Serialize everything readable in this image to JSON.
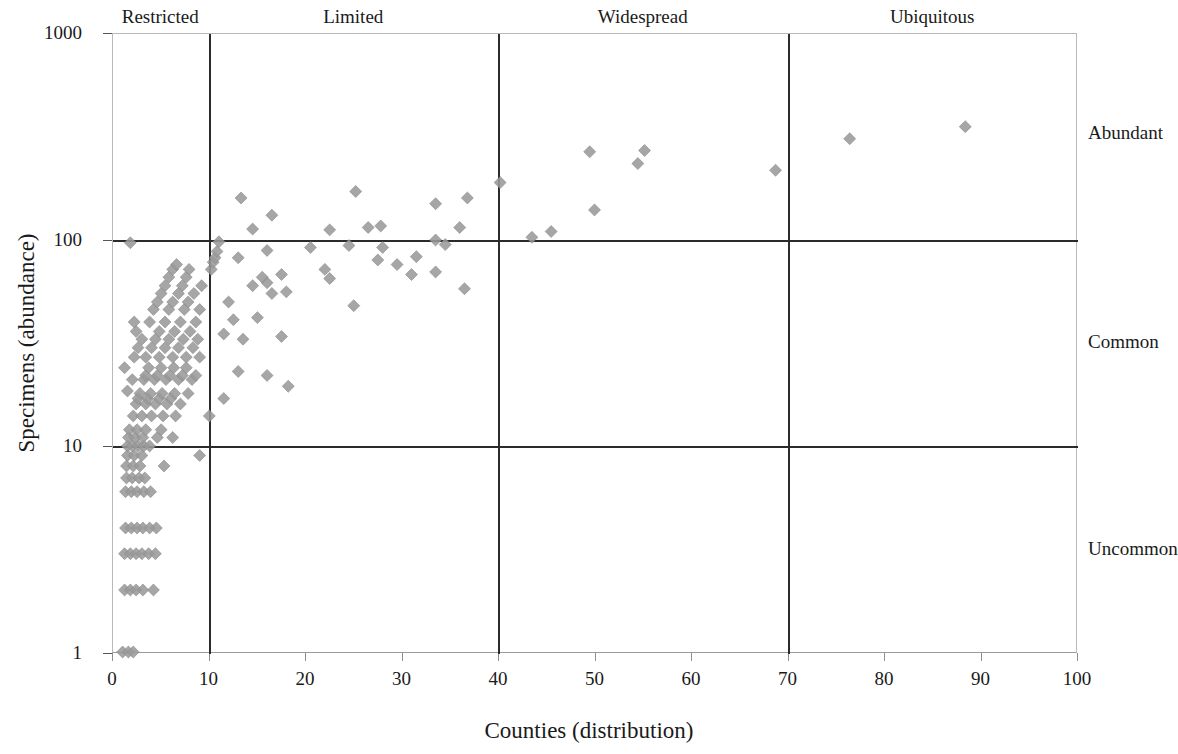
{
  "chart_data": {
    "type": "scatter",
    "title": "",
    "xlabel": "Counties (distribution)",
    "ylabel": "Specimens (abundance)",
    "xlim": [
      0,
      100
    ],
    "ylim": [
      1,
      1000
    ],
    "yscale": "log",
    "xscale": "linear",
    "grid": false,
    "legend": null,
    "marker": {
      "shape": "diamond",
      "color": "#9a9a9a",
      "size": 11
    },
    "x_ticks": [
      0,
      10,
      20,
      30,
      40,
      50,
      60,
      70,
      80,
      90,
      100
    ],
    "y_ticks": [
      1,
      10,
      100,
      1000
    ],
    "x_tick_labels": [
      "0",
      "10",
      "20",
      "30",
      "40",
      "50",
      "60",
      "70",
      "80",
      "90",
      "100"
    ],
    "y_tick_labels": [
      "1",
      "10",
      "100",
      "1000"
    ],
    "distribution_bands": [
      {
        "label": "Restricted",
        "x_range": [
          0,
          10
        ],
        "center": 5
      },
      {
        "label": "Limited",
        "x_range": [
          10,
          40
        ],
        "center": 25
      },
      {
        "label": "Widespread",
        "x_range": [
          40,
          70
        ],
        "center": 55
      },
      {
        "label": "Ubiquitous",
        "x_range": [
          70,
          100
        ],
        "center": 85
      }
    ],
    "abundance_bands": [
      {
        "label": "Abundant",
        "y_range": [
          100,
          1000
        ],
        "label_y": 330
      },
      {
        "label": "Common",
        "y_range": [
          10,
          100
        ],
        "label_y": 32
      },
      {
        "label": "Uncommon",
        "y_range": [
          1,
          10
        ],
        "label_y": 3.2
      }
    ],
    "vertical_divider_x": [
      10,
      40,
      70
    ],
    "horizontal_divider_y": [
      10,
      100
    ],
    "points": [
      [
        1.0,
        1.0
      ],
      [
        1.6,
        1.0
      ],
      [
        2.1,
        1.0
      ],
      [
        1.2,
        2.0
      ],
      [
        1.8,
        2.0
      ],
      [
        2.4,
        2.0
      ],
      [
        3.1,
        2.0
      ],
      [
        4.2,
        2.0
      ],
      [
        1.2,
        3.0
      ],
      [
        1.8,
        3.0
      ],
      [
        2.4,
        3.0
      ],
      [
        3.0,
        3.0
      ],
      [
        3.7,
        3.0
      ],
      [
        4.4,
        3.0
      ],
      [
        1.3,
        4.0
      ],
      [
        1.9,
        4.0
      ],
      [
        2.5,
        4.0
      ],
      [
        3.1,
        4.0
      ],
      [
        3.8,
        4.0
      ],
      [
        4.5,
        4.0
      ],
      [
        1.3,
        6.0
      ],
      [
        1.9,
        6.0
      ],
      [
        2.5,
        6.0
      ],
      [
        3.2,
        6.0
      ],
      [
        3.9,
        6.0
      ],
      [
        1.4,
        7.0
      ],
      [
        2.0,
        7.0
      ],
      [
        2.7,
        7.0
      ],
      [
        3.3,
        7.0
      ],
      [
        1.4,
        8.0
      ],
      [
        2.1,
        8.0
      ],
      [
        2.8,
        8.0
      ],
      [
        5.3,
        8.0
      ],
      [
        1.5,
        9.0
      ],
      [
        2.2,
        9.0
      ],
      [
        3.0,
        9.0
      ],
      [
        9.0,
        9.0
      ],
      [
        1.5,
        10.0
      ],
      [
        2.0,
        10.0
      ],
      [
        2.6,
        10.0
      ],
      [
        3.2,
        10.0
      ],
      [
        3.8,
        10.0
      ],
      [
        1.6,
        11.0
      ],
      [
        2.3,
        11.0
      ],
      [
        3.1,
        11.0
      ],
      [
        4.6,
        11.0
      ],
      [
        6.2,
        11.0
      ],
      [
        1.7,
        12.0
      ],
      [
        2.5,
        12.0
      ],
      [
        3.4,
        12.0
      ],
      [
        5.0,
        12.0
      ],
      [
        2.1,
        14.0
      ],
      [
        3.0,
        14.0
      ],
      [
        4.0,
        14.0
      ],
      [
        5.2,
        14.0
      ],
      [
        6.5,
        14.0
      ],
      [
        10.0,
        14.0
      ],
      [
        2.4,
        16.0
      ],
      [
        3.4,
        16.0
      ],
      [
        4.4,
        16.0
      ],
      [
        5.6,
        16.0
      ],
      [
        7.0,
        16.0
      ],
      [
        2.6,
        17.0
      ],
      [
        3.6,
        17.0
      ],
      [
        4.8,
        17.0
      ],
      [
        6.0,
        17.0
      ],
      [
        11.5,
        17.0
      ],
      [
        2.8,
        18.0
      ],
      [
        3.9,
        18.0
      ],
      [
        5.1,
        18.0
      ],
      [
        6.4,
        18.0
      ],
      [
        7.8,
        18.0
      ],
      [
        1.5,
        18.5
      ],
      [
        18.2,
        19.5
      ],
      [
        2.0,
        21.0
      ],
      [
        3.2,
        21.0
      ],
      [
        4.3,
        21.0
      ],
      [
        5.5,
        21.0
      ],
      [
        6.8,
        21.0
      ],
      [
        8.2,
        21.0
      ],
      [
        3.4,
        22.0
      ],
      [
        4.6,
        22.0
      ],
      [
        5.9,
        22.0
      ],
      [
        7.2,
        22.0
      ],
      [
        8.6,
        22.0
      ],
      [
        16.0,
        22.0
      ],
      [
        13.0,
        23.0
      ],
      [
        1.2,
        24.0
      ],
      [
        3.7,
        24.0
      ],
      [
        5.0,
        24.0
      ],
      [
        6.3,
        24.0
      ],
      [
        7.6,
        24.0
      ],
      [
        2.2,
        27.0
      ],
      [
        3.4,
        27.0
      ],
      [
        4.8,
        27.0
      ],
      [
        6.2,
        27.0
      ],
      [
        7.6,
        27.0
      ],
      [
        9.0,
        27.0
      ],
      [
        2.6,
        30.0
      ],
      [
        4.0,
        30.0
      ],
      [
        5.4,
        30.0
      ],
      [
        6.8,
        30.0
      ],
      [
        8.3,
        30.0
      ],
      [
        3.0,
        33.0
      ],
      [
        4.4,
        33.0
      ],
      [
        5.8,
        33.0
      ],
      [
        7.3,
        33.0
      ],
      [
        8.8,
        33.0
      ],
      [
        13.5,
        33.0
      ],
      [
        17.5,
        34.0
      ],
      [
        11.5,
        35.0
      ],
      [
        2.4,
        36.0
      ],
      [
        4.8,
        36.0
      ],
      [
        6.4,
        36.0
      ],
      [
        8.0,
        36.0
      ],
      [
        2.2,
        40.0
      ],
      [
        3.8,
        40.0
      ],
      [
        5.4,
        40.0
      ],
      [
        7.0,
        40.0
      ],
      [
        8.6,
        40.0
      ],
      [
        12.5,
        41.0
      ],
      [
        15.0,
        42.0
      ],
      [
        4.2,
        46.0
      ],
      [
        5.8,
        46.0
      ],
      [
        7.4,
        46.0
      ],
      [
        9.0,
        46.0
      ],
      [
        4.6,
        50.0
      ],
      [
        6.2,
        50.0
      ],
      [
        7.8,
        50.0
      ],
      [
        12.0,
        50.0
      ],
      [
        25.0,
        48.0
      ],
      [
        5.0,
        55.0
      ],
      [
        6.8,
        55.0
      ],
      [
        8.4,
        55.0
      ],
      [
        16.5,
        55.0
      ],
      [
        18.0,
        56.0
      ],
      [
        5.4,
        60.0
      ],
      [
        7.2,
        60.0
      ],
      [
        9.2,
        60.0
      ],
      [
        14.5,
        60.0
      ],
      [
        16.0,
        62.0
      ],
      [
        36.5,
        58.0
      ],
      [
        5.8,
        66.0
      ],
      [
        7.6,
        66.0
      ],
      [
        15.5,
        66.0
      ],
      [
        17.5,
        68.0
      ],
      [
        6.2,
        72.0
      ],
      [
        7.9,
        72.0
      ],
      [
        10.2,
        72.0
      ],
      [
        22.5,
        65.0
      ],
      [
        31.0,
        68.0
      ],
      [
        6.6,
        76.0
      ],
      [
        10.4,
        78.0
      ],
      [
        22.0,
        72.0
      ],
      [
        29.5,
        76.0
      ],
      [
        33.5,
        70.0
      ],
      [
        10.6,
        82.0
      ],
      [
        13.0,
        82.0
      ],
      [
        27.5,
        80.0
      ],
      [
        31.5,
        83.0
      ],
      [
        10.8,
        88.0
      ],
      [
        16.0,
        89.0
      ],
      [
        20.5,
        92.0
      ],
      [
        24.5,
        94.0
      ],
      [
        28.0,
        92.0
      ],
      [
        34.5,
        95.0
      ],
      [
        43.5,
        103.0
      ],
      [
        45.5,
        110.0
      ],
      [
        33.5,
        100.0
      ],
      [
        1.8,
        97.0
      ],
      [
        11.0,
        98.0
      ],
      [
        22.5,
        112.0
      ],
      [
        14.5,
        113.0
      ],
      [
        26.5,
        115.0
      ],
      [
        27.8,
        117.0
      ],
      [
        36.0,
        115.0
      ],
      [
        16.5,
        132.0
      ],
      [
        33.5,
        150.0
      ],
      [
        50.0,
        140.0
      ],
      [
        13.3,
        160.0
      ],
      [
        36.8,
        160.0
      ],
      [
        25.2,
        172.0
      ],
      [
        40.2,
        190.0
      ],
      [
        68.8,
        218.0
      ],
      [
        54.5,
        235.0
      ],
      [
        49.5,
        268.0
      ],
      [
        55.2,
        272.0
      ],
      [
        76.5,
        310.0
      ],
      [
        88.5,
        355.0
      ]
    ]
  },
  "axes": {
    "y_title": "Specimens (abundance)",
    "x_title": "Counties (distribution)"
  }
}
